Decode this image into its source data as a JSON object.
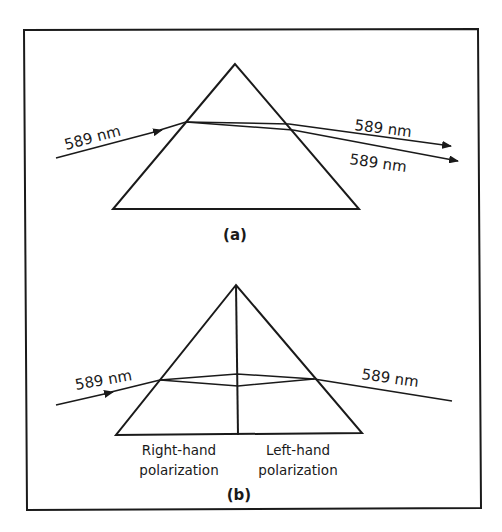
{
  "colors": {
    "background": "#ffffff",
    "ink": "#1a1a1a"
  },
  "panel_a": {
    "caption": "(a)",
    "incident_label": "589 nm",
    "exit_label_upper": "589 nm",
    "exit_label_lower": "589 nm"
  },
  "panel_b": {
    "caption": "(b)",
    "incident_label": "589 nm",
    "exit_label": "589 nm",
    "left_half_label_line1": "Right-hand",
    "left_half_label_line2": "polarization",
    "right_half_label_line1": "Left-hand",
    "right_half_label_line2": "polarization"
  }
}
